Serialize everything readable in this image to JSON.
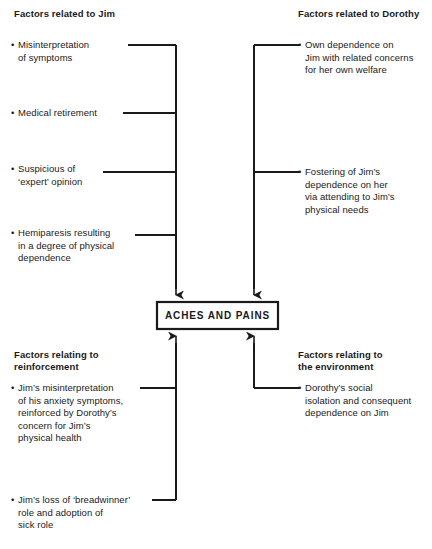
{
  "diagram": {
    "title": "ACHES AND PAINS",
    "center_node": {
      "label": "ACHES AND PAINS"
    },
    "line_color": "#1a1a1a",
    "background_color": "#ffffff",
    "text_color": "#1a1a1a",
    "quadrants": {
      "top_left": {
        "heading": "Factors related to Jim",
        "bullet_marker": "•",
        "items": [
          {
            "text": "Misinterpretation\nof symptoms"
          },
          {
            "text": "Medical retirement"
          },
          {
            "text": "Suspicious of\n‘expert’ opinion"
          },
          {
            "text": "Hemiparesis resulting\nin a degree of physical\ndependence"
          }
        ]
      },
      "top_right": {
        "heading": "Factors related to Dorothy",
        "bullet_marker": "•",
        "items": [
          {
            "text": "Own dependence on\nJim with related concerns\nfor her own welfare"
          },
          {
            "text": "Fostering of Jim’s\ndependence on her\nvia attending to Jim’s\nphysical needs"
          }
        ]
      },
      "bottom_left": {
        "heading": "Factors relating to\nreinforcement",
        "bullet_marker": "•",
        "items": [
          {
            "text": "Jim’s misinterpretation\nof his anxiety symptoms,\nreinforced by Dorothy’s\nconcern for Jim’s\nphysical health"
          },
          {
            "text": "Jim’s loss of ‘breadwinner’\nrole and adoption of\nsick role"
          }
        ]
      },
      "bottom_right": {
        "heading": "Factors relating to\nthe environment",
        "bullet_marker": "•",
        "items": [
          {
            "text": "Dorothy’s social\nisolation and consequent\ndependence on Jim"
          }
        ]
      }
    }
  }
}
